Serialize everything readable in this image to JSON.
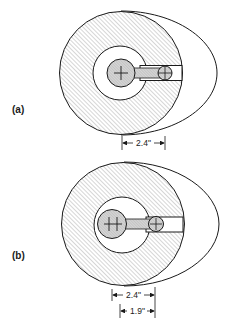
{
  "diagram": {
    "panels": [
      {
        "id": "a",
        "label": "(a)",
        "dimensions": [
          {
            "text": "2.4\""
          }
        ]
      },
      {
        "id": "b",
        "label": "(b)",
        "dimensions": [
          {
            "text": "2.4\""
          },
          {
            "text": "1.9\""
          }
        ]
      }
    ],
    "colors": {
      "stroke": "#1a1a1a",
      "hatch": "#8a8a8a",
      "hub_fill": "#c8c8c8",
      "background": "#ffffff"
    }
  }
}
